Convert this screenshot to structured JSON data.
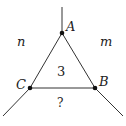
{
  "diagram": {
    "type": "triangle-with-extended-rays",
    "vertices": {
      "A": {
        "label": "A",
        "x": 62,
        "y": 33
      },
      "B": {
        "label": "B",
        "x": 95,
        "y": 88
      },
      "C": {
        "label": "C",
        "x": 30,
        "y": 88
      }
    },
    "region_labels": {
      "left": "n",
      "right": "m",
      "inside": "3",
      "bottom": "?"
    },
    "colors": {
      "line": "#333333",
      "point": "#111111",
      "background": "#ffffff"
    }
  }
}
